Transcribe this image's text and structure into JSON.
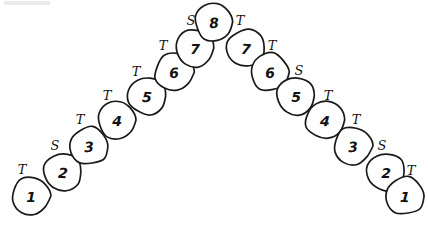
{
  "figure": {
    "background_color": "#ffffff",
    "ink_color": "#1a1a1a",
    "width": 428,
    "height": 227,
    "node_radius": 19
  },
  "left_chain": {
    "name": "ascending-left-chain",
    "nodes": [
      {
        "label": "1",
        "cx": 31,
        "cy": 196
      },
      {
        "label": "2",
        "cx": 63,
        "cy": 172
      },
      {
        "label": "3",
        "cx": 89,
        "cy": 146
      },
      {
        "label": "4",
        "cx": 117,
        "cy": 120
      },
      {
        "label": "5",
        "cx": 147,
        "cy": 96
      },
      {
        "label": "6",
        "cx": 174,
        "cy": 72
      },
      {
        "label": "7",
        "cx": 195,
        "cy": 48
      }
    ],
    "edge_labels": [
      {
        "label": "T",
        "x": 22,
        "y": 169
      },
      {
        "label": "S",
        "x": 55,
        "y": 145
      },
      {
        "label": "T",
        "x": 80,
        "y": 119
      },
      {
        "label": "T",
        "x": 107,
        "y": 95
      },
      {
        "label": "T",
        "x": 136,
        "y": 71
      },
      {
        "label": "T",
        "x": 163,
        "y": 45
      },
      {
        "label": "S",
        "x": 191,
        "y": 20
      }
    ]
  },
  "apex": {
    "name": "apex-node",
    "node": {
      "label": "8",
      "cx": 214,
      "cy": 22
    }
  },
  "right_chain": {
    "name": "descending-right-chain",
    "nodes": [
      {
        "label": "7",
        "cx": 246,
        "cy": 48
      },
      {
        "label": "6",
        "cx": 270,
        "cy": 72
      },
      {
        "label": "5",
        "cx": 296,
        "cy": 96
      },
      {
        "label": "4",
        "cx": 325,
        "cy": 120
      },
      {
        "label": "3",
        "cx": 353,
        "cy": 146
      },
      {
        "label": "2",
        "cx": 386,
        "cy": 172
      },
      {
        "label": "1",
        "cx": 405,
        "cy": 196
      }
    ],
    "edge_labels": [
      {
        "label": "T",
        "x": 240,
        "y": 20
      },
      {
        "label": "T",
        "x": 272,
        "y": 45
      },
      {
        "label": "S",
        "x": 299,
        "y": 70
      },
      {
        "label": "T",
        "x": 328,
        "y": 95
      },
      {
        "label": "T",
        "x": 356,
        "y": 119
      },
      {
        "label": "S",
        "x": 382,
        "y": 145
      },
      {
        "label": "T",
        "x": 411,
        "y": 170
      }
    ]
  },
  "artifacts": [
    {
      "name": "scan-smudge-top-left",
      "x": 4,
      "y": 1,
      "width": 46,
      "height": 4
    }
  ]
}
